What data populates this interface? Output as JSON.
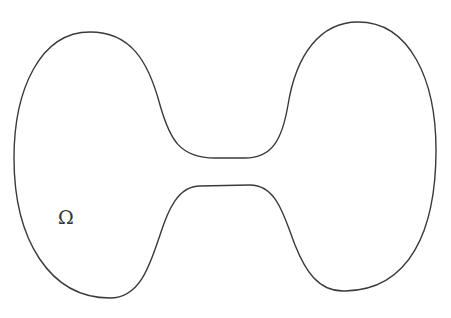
{
  "diagram": {
    "label": "Ω",
    "stroke_color": "#3a3a3a",
    "background": "#ffffff",
    "shape": "dumbbell-domain"
  }
}
